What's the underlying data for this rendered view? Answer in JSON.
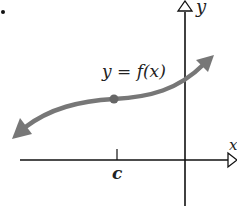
{
  "figure": {
    "marker": ".",
    "curve_label": "y = f(x)",
    "x_axis_label": "x",
    "y_axis_label": "y",
    "tick_label": "c"
  },
  "colors": {
    "curve": "#777777",
    "axes": "#111111",
    "text": "#222222",
    "background": "#ffffff"
  }
}
